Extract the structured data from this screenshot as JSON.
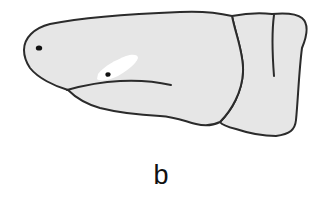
{
  "figure": {
    "panel_label": "b",
    "colors": {
      "fill": "#e6e6e6",
      "outline": "#2b2b2b",
      "highlight": "#ffffff",
      "dots": "#111111",
      "background": "#ffffff"
    },
    "parts": [
      {
        "name": "anterior-segment",
        "has_eye_dot": true,
        "has_white_patch": true,
        "has_inner_suture": true
      },
      {
        "name": "middle-segment"
      },
      {
        "name": "posterior-segment",
        "has_partial_suture": true
      }
    ]
  }
}
